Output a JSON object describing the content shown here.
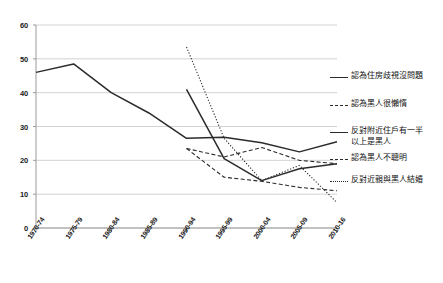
{
  "chart_data": {
    "type": "line",
    "title": "",
    "xlabel": "",
    "ylabel": "",
    "ylim": [
      0,
      60
    ],
    "yticks": [
      0,
      10,
      20,
      30,
      40,
      50,
      60
    ],
    "grid": true,
    "legend_position": "right",
    "categories": [
      "1970-74",
      "1975-79",
      "1980-84",
      "1985-89",
      "1990-94",
      "1995-99",
      "2000-04",
      "2005-09",
      "2010-16"
    ],
    "series": [
      {
        "name": "認為住房歧視沒問題",
        "style": "solid",
        "color": "#2b2b2b",
        "values": [
          46.0,
          48.5,
          40.0,
          34.0,
          26.5,
          26.8,
          25.2,
          22.5,
          25.5
        ]
      },
      {
        "name": "認為黑人很懶惰",
        "style": "dashed",
        "color": "#2b2b2b",
        "values": [
          null,
          null,
          null,
          null,
          23.5,
          21.0,
          23.8,
          20.0,
          19.0
        ]
      },
      {
        "name": "反對附近住戶有一半以上是黑人",
        "style": "solid",
        "color": "#2b2b2b",
        "values": [
          null,
          null,
          null,
          null,
          41.0,
          20.5,
          14.0,
          17.5,
          19.0
        ]
      },
      {
        "name": "認為黑人不聰明",
        "style": "dashed",
        "color": "#2b2b2b",
        "values": [
          null,
          null,
          null,
          null,
          23.5,
          15.0,
          13.8,
          12.0,
          11.0
        ]
      },
      {
        "name": "反對近親與黑人結婚",
        "style": "dotted",
        "color": "#2b2b2b",
        "values": [
          null,
          null,
          null,
          null,
          53.5,
          26.5,
          14.0,
          18.5,
          7.5
        ]
      }
    ]
  },
  "axis": {
    "y_tick_labels": [
      "60",
      "50",
      "40",
      "30",
      "20",
      "10",
      "0"
    ],
    "x_tick_labels": [
      "1970-74",
      "1975-79",
      "1980-84",
      "1985-89",
      "1990-94",
      "1995-99",
      "2000-04",
      "2005-09",
      "2010-16"
    ]
  },
  "legend": {
    "items": [
      {
        "label": "認為住房歧視沒問題",
        "style": "solid"
      },
      {
        "label": "認為黑人很懶惰",
        "style": "dashed"
      },
      {
        "label": "反對附近住戶有一半\n以上是黑人",
        "style": "solid"
      },
      {
        "label": "認為黑人不聰明",
        "style": "dashed"
      },
      {
        "label": "反對近親與黑人結婚",
        "style": "dotted"
      }
    ]
  },
  "colors": {
    "line": "#2b2b2b",
    "grid": "#c8c8c8",
    "axis": "#9a9a9a",
    "text": "#1a1a1a",
    "background": "#ffffff"
  }
}
